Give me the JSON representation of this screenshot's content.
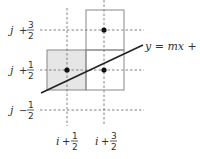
{
  "diagram": {
    "type": "midpoint line-rasterization grid",
    "equation": "y = mx + h",
    "row_labels": [
      {
        "var": "j",
        "op": "+",
        "num": "3",
        "den": "2"
      },
      {
        "var": "j",
        "op": "+",
        "num": "1",
        "den": "2"
      },
      {
        "var": "j",
        "op": "−",
        "num": "1",
        "den": "2"
      }
    ],
    "col_labels": [
      {
        "var": "i",
        "op": "+",
        "num": "1",
        "den": "2"
      },
      {
        "var": "i",
        "op": "+",
        "num": "3",
        "den": "2"
      }
    ],
    "colors": {
      "shaded_pixel": "#e6e6e6",
      "box_stroke": "#888888",
      "dash": "#777777",
      "line": "#222222",
      "dot": "#111111"
    },
    "pixels": [
      {
        "name": "current-pixel",
        "shaded": true
      },
      {
        "name": "candidate-upper-pixel",
        "shaded": false
      },
      {
        "name": "candidate-right-pixel",
        "shaded": false
      }
    ]
  }
}
